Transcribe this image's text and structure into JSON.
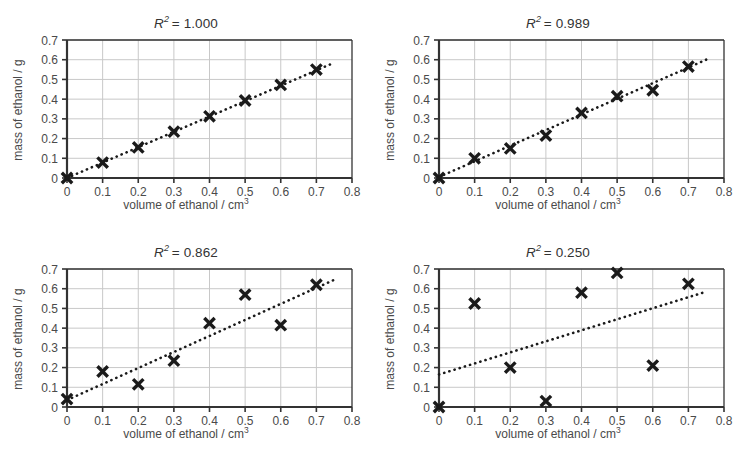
{
  "figure": {
    "name": "four-scatter-plots-r-squared",
    "background": "#ffffff",
    "axis_color": "#333333",
    "grid_color": "#c8c8c8",
    "marker_color": "#1a1a1a",
    "trendline_color": "#1a1a1a"
  },
  "axes_common": {
    "xlabel_text": "volume of ethanol / cm",
    "xlabel_sup": "3",
    "ylabel": "mass of ethanol / g",
    "xticks": [
      "0",
      "0.1",
      "0.2",
      "0.3",
      "0.4",
      "0.5",
      "0.6",
      "0.7",
      "0.8"
    ],
    "yticks": [
      "0",
      "0.1",
      "0.2",
      "0.3",
      "0.4",
      "0.5",
      "0.6",
      "0.7"
    ],
    "xlim": [
      0,
      0.8
    ],
    "ylim": [
      0,
      0.7
    ]
  },
  "chart_data": [
    {
      "id": "panel-top-left",
      "type": "scatter",
      "title": "R² = 1.000",
      "title_prefix": "R",
      "title_sup": "2",
      "title_value": "= 1.000",
      "r_squared": 1.0,
      "xlabel": "volume of ethanol / cm3",
      "ylabel": "mass of ethanol / g",
      "xlim": [
        0,
        0.8
      ],
      "ylim": [
        0,
        0.7
      ],
      "grid": true,
      "legend": "none",
      "x": [
        0,
        0.1,
        0.2,
        0.3,
        0.4,
        0.5,
        0.6,
        0.7
      ],
      "y": [
        0.0,
        0.078,
        0.155,
        0.235,
        0.313,
        0.393,
        0.472,
        0.55
      ],
      "trendline": {
        "style": "dotted",
        "x0": 0.0,
        "y0": 0.0,
        "x1": 0.75,
        "y1": 0.585
      }
    },
    {
      "id": "panel-top-right",
      "type": "scatter",
      "title": "R² = 0.989",
      "title_prefix": "R",
      "title_sup": "2",
      "title_value": "= 0.989",
      "r_squared": 0.989,
      "xlabel": "volume of ethanol / cm3",
      "ylabel": "mass of ethanol / g",
      "xlim": [
        0,
        0.8
      ],
      "ylim": [
        0,
        0.7
      ],
      "grid": true,
      "legend": "none",
      "x": [
        0,
        0.1,
        0.2,
        0.3,
        0.4,
        0.5,
        0.6,
        0.7
      ],
      "y": [
        0.0,
        0.1,
        0.15,
        0.215,
        0.33,
        0.415,
        0.445,
        0.565
      ],
      "trendline": {
        "style": "dotted",
        "x0": 0.0,
        "y0": 0.005,
        "x1": 0.75,
        "y1": 0.6
      }
    },
    {
      "id": "panel-bottom-left",
      "type": "scatter",
      "title": "R² = 0.862",
      "title_prefix": "R",
      "title_sup": "2",
      "title_value": "= 0.862",
      "r_squared": 0.862,
      "xlabel": "volume of ethanol / cm3",
      "ylabel": "mass of ethanol / g",
      "xlim": [
        0,
        0.8
      ],
      "ylim": [
        0,
        0.7
      ],
      "grid": true,
      "legend": "none",
      "x": [
        0,
        0.1,
        0.2,
        0.3,
        0.4,
        0.5,
        0.6,
        0.7
      ],
      "y": [
        0.04,
        0.18,
        0.115,
        0.235,
        0.425,
        0.57,
        0.415,
        0.62
      ],
      "trendline": {
        "style": "dotted",
        "x0": 0.0,
        "y0": 0.035,
        "x1": 0.75,
        "y1": 0.645
      }
    },
    {
      "id": "panel-bottom-right",
      "type": "scatter",
      "title": "R² = 0.250",
      "title_prefix": "R",
      "title_sup": "2",
      "title_value": "= 0.250",
      "r_squared": 0.25,
      "xlabel": "volume of ethanol / cm3",
      "ylabel": "mass of ethanol / g",
      "xlim": [
        0,
        0.8
      ],
      "ylim": [
        0,
        0.7
      ],
      "grid": true,
      "legend": "none",
      "x": [
        0,
        0.1,
        0.2,
        0.3,
        0.4,
        0.5,
        0.6,
        0.7
      ],
      "y": [
        0.0,
        0.525,
        0.2,
        0.03,
        0.58,
        0.68,
        0.21,
        0.625
      ],
      "trendline": {
        "style": "dotted",
        "x0": 0.0,
        "y0": 0.165,
        "x1": 0.75,
        "y1": 0.585
      }
    }
  ]
}
